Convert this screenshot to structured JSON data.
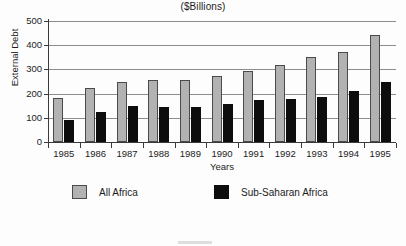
{
  "chart_data": {
    "type": "bar",
    "title": "($Billions)",
    "xlabel": "Years",
    "ylabel": "External Debt",
    "categories": [
      "1985",
      "1986",
      "1987",
      "1988",
      "1989",
      "1990",
      "1991",
      "1992",
      "1993",
      "1994",
      "1995"
    ],
    "series": [
      {
        "name": "All Africa",
        "color": "#b2b2b2",
        "values": [
          180,
          222,
          246,
          255,
          255,
          271,
          293,
          319,
          352,
          374,
          442
        ]
      },
      {
        "name": "Sub-Saharan Africa",
        "color": "#0d0d0d",
        "values": [
          92,
          125,
          147,
          146,
          146,
          158,
          172,
          176,
          184,
          212,
          247
        ]
      }
    ],
    "ylim": [
      0,
      500
    ],
    "yticks": [
      "0",
      "100",
      "200",
      "300",
      "400",
      "500"
    ],
    "ytick_values": [
      0,
      100,
      200,
      300,
      400,
      500
    ],
    "grid": true,
    "grid_axis": "y",
    "legend_position": "bottom"
  },
  "legend": {
    "entries": [
      {
        "label": "All Africa"
      },
      {
        "label": "Sub-Saharan Africa"
      }
    ]
  }
}
